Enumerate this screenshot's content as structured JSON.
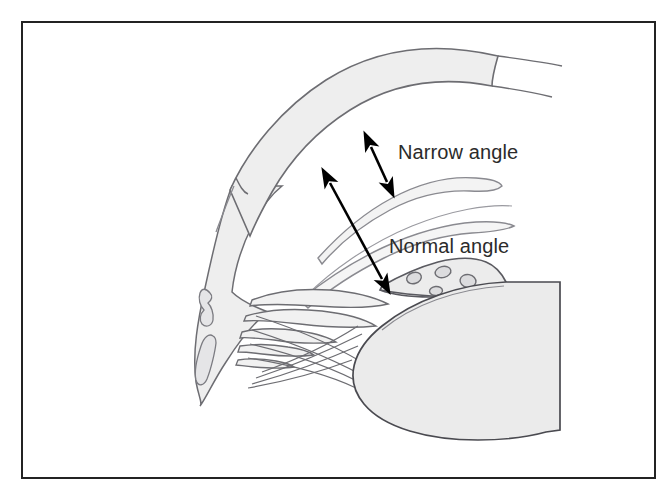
{
  "figure": {
    "border": {
      "color": "#232323",
      "width": 2,
      "x": 22,
      "y": 22,
      "w": 633,
      "h": 456
    },
    "background_color": "#ffffff"
  },
  "palette": {
    "tissue_fill": "#eeeeee",
    "tissue_fill_light": "#f3f3f3",
    "lens_fill": "#ebebeb",
    "outline": "#6d6d72",
    "outline_dark": "#4a4a50",
    "arrow_color": "#000000",
    "label_color": "#2b2b2b"
  },
  "labels": [
    {
      "id": "narrow-angle",
      "text": "Narrow angle",
      "x": 398,
      "y": 159,
      "font_size": 20
    },
    {
      "id": "normal-angle",
      "text": "Normal angle",
      "x": 389,
      "y": 253,
      "font_size": 20
    }
  ],
  "arrows": [
    {
      "id": "narrow-angle-arrow",
      "description": "short double-headed arrow spanning the narrow anterior chamber angle",
      "x1": 371,
      "y1": 147,
      "x2": 387,
      "y2": 182,
      "double_headed": true
    },
    {
      "id": "normal-angle-arrow",
      "description": "long double-headed arrow spanning the normal anterior chamber angle",
      "x1": 330,
      "y1": 183,
      "x2": 382,
      "y2": 279,
      "double_headed": true
    }
  ],
  "anatomy": [
    {
      "id": "cornea-sclera-band",
      "label": "cornea and sclera band"
    },
    {
      "id": "sclera-body",
      "label": "scleral body"
    },
    {
      "id": "scleral-vessel-upper",
      "label": "scleral vessel"
    },
    {
      "id": "scleral-vessel-lower",
      "label": "scleral vessel"
    },
    {
      "id": "iris-narrow-position",
      "label": "iris in narrow-angle position"
    },
    {
      "id": "iris-normal-position",
      "label": "iris in normal-angle position"
    },
    {
      "id": "ciliary-body",
      "label": "ciliary body with processes"
    },
    {
      "id": "ciliary-processes",
      "label": "ciliary processes"
    },
    {
      "id": "zonular-fibers",
      "label": "zonular fibers"
    },
    {
      "id": "lens",
      "label": "crystalline lens"
    },
    {
      "id": "trabecular-meshwork",
      "label": "trabecular meshwork region"
    }
  ]
}
